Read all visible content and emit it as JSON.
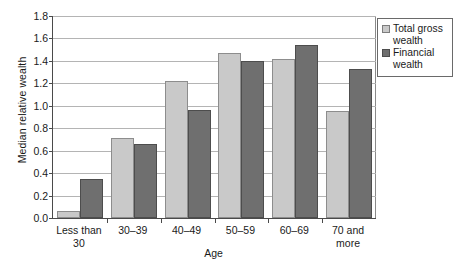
{
  "chart_data": {
    "type": "bar",
    "title": "",
    "subtitle": "",
    "xlabel": "Age",
    "ylabel": "Median relative wealth",
    "ylim": [
      0.0,
      1.8
    ],
    "ytick_labels": [
      "0.0",
      "0.2",
      "0.4",
      "0.6",
      "0.8",
      "1.0",
      "1.2",
      "1.4",
      "1.6",
      "1.8"
    ],
    "ytick_values": [
      0.0,
      0.2,
      0.4,
      0.6,
      0.8,
      1.0,
      1.2,
      1.4,
      1.6,
      1.8
    ],
    "grid": true,
    "grid_axis": "y",
    "legend_position": "top-right-outside",
    "categories": [
      "Less than\n30",
      "30–39",
      "40–49",
      "50–59",
      "60–69",
      "70 and\nmore"
    ],
    "series": [
      {
        "name": "Total gross wealth",
        "color": "#c9c9c9",
        "values": [
          0.06,
          0.71,
          1.22,
          1.47,
          1.42,
          0.95
        ]
      },
      {
        "name": "Financial wealth",
        "color": "#6f6f6f",
        "values": [
          0.35,
          0.66,
          0.96,
          1.4,
          1.54,
          1.33
        ]
      }
    ]
  },
  "legend": {
    "entries": [
      {
        "label": "Total gross wealth"
      },
      {
        "label": "Financial wealth"
      }
    ]
  }
}
